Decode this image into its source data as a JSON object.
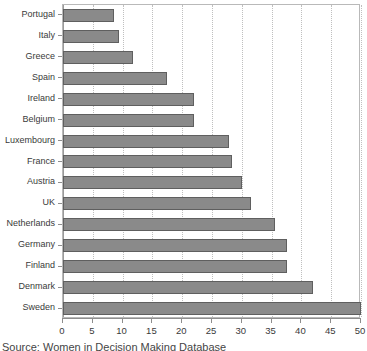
{
  "chart_data": {
    "type": "bar",
    "orientation": "horizontal",
    "title": "",
    "xlabel": "",
    "ylabel": "",
    "xlim": [
      0,
      50
    ],
    "xticks": [
      0,
      5,
      10,
      15,
      20,
      25,
      30,
      35,
      40,
      45,
      50
    ],
    "xtick_labels": [
      "0",
      "5",
      "10",
      "15",
      "20",
      "25",
      "30",
      "35",
      "40",
      "45",
      "50"
    ],
    "grid": "vertical-dotted",
    "legend": "none",
    "bar_color": "#8a8a8a",
    "bar_edge_color": "#5f5f5f",
    "categories": [
      "Portugal",
      "Italy",
      "Greece",
      "Spain",
      "Ireland",
      "Belgium",
      "Luxembourg",
      "France",
      "Austria",
      "UK",
      "Netherlands",
      "Germany",
      "Finland",
      "Denmark",
      "Sweden"
    ],
    "values": [
      8.6,
      9.4,
      11.7,
      17.5,
      22,
      22,
      27.8,
      28.4,
      30,
      31.5,
      35.5,
      37.5,
      37.5,
      42,
      50
    ]
  },
  "source": {
    "text": "Source: Women in Decision Making Database"
  }
}
